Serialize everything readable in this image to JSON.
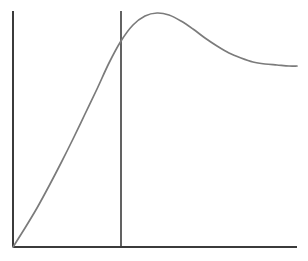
{
  "figure": {
    "background_color": "#ffffff",
    "width": 308,
    "height": 261
  },
  "chart_data": {
    "type": "line",
    "title": "",
    "subtitle": "",
    "xlabel": "",
    "ylabel": "",
    "legend": [],
    "legend_position": "none",
    "grid": false,
    "axes": {
      "x_axis_visible": true,
      "y_axis_visible": true,
      "x_tick_labels": [],
      "y_tick_labels": [],
      "xlim": [
        0,
        1
      ],
      "ylim": [
        0,
        1
      ],
      "origin_px": [
        13,
        247
      ],
      "x_axis_end_px": [
        297,
        247
      ],
      "y_axis_top_px": [
        13,
        11
      ]
    },
    "series": [
      {
        "name": "curve",
        "color": "#7b7b7b",
        "line_width": 1.7,
        "shape": "rise-to-peak-then-decay-to-plateau",
        "points_px": [
          [
            13,
            247
          ],
          [
            25,
            228
          ],
          [
            37,
            208
          ],
          [
            49,
            186
          ],
          [
            61,
            163
          ],
          [
            73,
            139
          ],
          [
            85,
            114
          ],
          [
            97,
            89
          ],
          [
            109,
            63
          ],
          [
            121,
            41
          ],
          [
            133,
            25
          ],
          [
            145,
            16
          ],
          [
            157,
            13
          ],
          [
            169,
            15
          ],
          [
            181,
            21
          ],
          [
            193,
            29
          ],
          [
            205,
            38
          ],
          [
            217,
            46
          ],
          [
            229,
            53
          ],
          [
            241,
            58
          ],
          [
            253,
            62
          ],
          [
            265,
            64
          ],
          [
            277,
            65
          ],
          [
            289,
            66
          ],
          [
            297,
            66
          ]
        ],
        "points_data": [
          [
            0.0,
            0.0
          ],
          [
            0.042,
            0.081
          ],
          [
            0.085,
            0.165
          ],
          [
            0.127,
            0.258
          ],
          [
            0.169,
            0.356
          ],
          [
            0.211,
            0.458
          ],
          [
            0.254,
            0.564
          ],
          [
            0.296,
            0.669
          ],
          [
            0.338,
            0.78
          ],
          [
            0.38,
            0.873
          ],
          [
            0.423,
            0.941
          ],
          [
            0.465,
            0.979
          ],
          [
            0.507,
            0.992
          ],
          [
            0.549,
            0.983
          ],
          [
            0.592,
            0.958
          ],
          [
            0.634,
            0.924
          ],
          [
            0.676,
            0.886
          ],
          [
            0.718,
            0.852
          ],
          [
            0.761,
            0.822
          ],
          [
            0.803,
            0.801
          ],
          [
            0.845,
            0.784
          ],
          [
            0.887,
            0.775
          ],
          [
            0.93,
            0.771
          ],
          [
            0.972,
            0.767
          ],
          [
            1.0,
            0.767
          ]
        ]
      }
    ],
    "annotations": [
      {
        "name": "vertical-marker-line",
        "type": "vline",
        "x_px": 121,
        "y_top_px": 11,
        "y_bottom_px": 247,
        "x_data": 0.38,
        "color": "#3b3b3b",
        "label": ""
      }
    ]
  }
}
